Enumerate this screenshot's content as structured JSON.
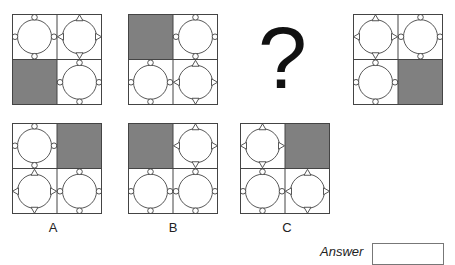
{
  "colors": {
    "gray_fill": "#808080",
    "line": "#444444"
  },
  "question": {
    "sequence": [
      {
        "id": "seq-1",
        "cells": [
          "circles",
          "triangles",
          "gray",
          "circles"
        ]
      },
      {
        "id": "seq-2",
        "cells": [
          "gray",
          "circles",
          "circles",
          "triangles"
        ]
      },
      {
        "id": "seq-3",
        "missing": true,
        "symbol": "?"
      },
      {
        "id": "seq-4",
        "cells": [
          "triangles",
          "circles",
          "circles",
          "gray"
        ]
      }
    ]
  },
  "options": [
    {
      "label": "A",
      "cells": [
        "circles",
        "gray",
        "triangles",
        "circles"
      ]
    },
    {
      "label": "B",
      "cells": [
        "gray",
        "triangles",
        "circles",
        "circles"
      ]
    },
    {
      "label": "C",
      "cells": [
        "triangles",
        "gray",
        "circles",
        "triangles"
      ]
    }
  ],
  "answer": {
    "label": "Answer",
    "value": ""
  }
}
